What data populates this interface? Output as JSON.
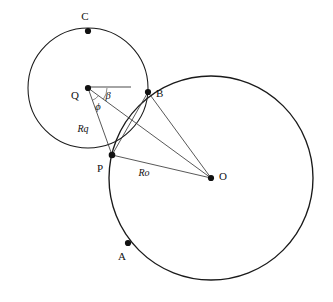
{
  "figure": {
    "background_color": "#ffffff",
    "stroke_color": "#1a1a1a",
    "width": 333,
    "height": 302
  },
  "points": {
    "C": {
      "label": "C",
      "x": 88,
      "y": 31,
      "label_x": 85,
      "label_y": 20
    },
    "Q": {
      "label": "Q",
      "x": 88,
      "y": 88,
      "label_x": 75,
      "label_y": 99
    },
    "B": {
      "label": "B",
      "x": 148,
      "y": 92,
      "label_x": 156,
      "label_y": 97
    },
    "P": {
      "label": "P",
      "x": 112,
      "y": 155,
      "label_x": 100,
      "label_y": 172
    },
    "O": {
      "label": "O",
      "x": 211,
      "y": 178,
      "label_x": 219,
      "label_y": 180
    },
    "A": {
      "label": "A",
      "x": 128,
      "y": 243,
      "label_x": 122,
      "label_y": 260
    }
  },
  "circles": {
    "small": {
      "name": "circle-Q",
      "cx": 88,
      "cy": 88,
      "r": 60
    },
    "large": {
      "name": "circle-O",
      "cx": 211,
      "cy": 178,
      "r": 102
    }
  },
  "labels": {
    "Rq": {
      "text": "Rq",
      "x": 83,
      "y": 132
    },
    "Ro": {
      "text": "Ro",
      "x": 144,
      "y": 176
    },
    "beta": {
      "text": "β",
      "x": 108,
      "y": 99
    },
    "phi": {
      "text": "ϕ",
      "x": 98,
      "y": 110
    }
  },
  "segments": [
    {
      "name": "segment-Q-to-horizontal-reference",
      "from": "Q",
      "to": "H",
      "x1": 88,
      "y1": 87,
      "x2": 131,
      "y2": 87
    },
    {
      "name": "segment-Q-to-O",
      "from": "Q",
      "to": "O",
      "x1": 88,
      "y1": 88,
      "x2": 211,
      "y2": 178
    },
    {
      "name": "segment-Q-to-P",
      "from": "Q",
      "to": "P",
      "x1": 88,
      "y1": 88,
      "x2": 112,
      "y2": 155
    },
    {
      "name": "segment-P-to-O",
      "from": "P",
      "to": "O",
      "x1": 112,
      "y1": 155,
      "x2": 211,
      "y2": 178
    },
    {
      "name": "segment-P-to-B",
      "from": "P",
      "to": "B",
      "x1": 112,
      "y1": 155,
      "x2": 148,
      "y2": 92
    },
    {
      "name": "segment-B-to-O",
      "from": "B",
      "to": "O",
      "x1": 148,
      "y1": 92,
      "x2": 211,
      "y2": 178
    }
  ],
  "angle_arcs": [
    {
      "name": "angle-arc-beta",
      "vertex": "Q",
      "radius": 19
    },
    {
      "name": "angle-arc-phi",
      "vertex": "Q",
      "radius": 13
    }
  ]
}
